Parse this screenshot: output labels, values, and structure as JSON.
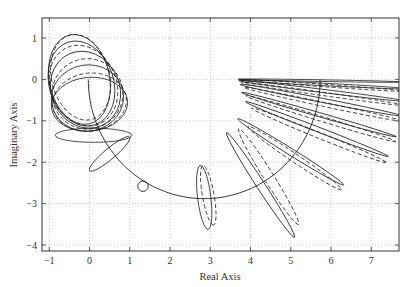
{
  "chart_data": {
    "type": "line",
    "title": "",
    "xlabel": "Real Axis",
    "ylabel": "Imaginary Axis",
    "xlim": [
      -1.18,
      7.69
    ],
    "ylim": [
      -4.14,
      1.48
    ],
    "grid": true,
    "x_ticks": [
      -1,
      0,
      1,
      2,
      3,
      4,
      5,
      6,
      7
    ],
    "x_tick_labels": [
      "−1",
      "0",
      "1",
      "2",
      "3",
      "4",
      "5",
      "6",
      "7"
    ],
    "y_ticks": [
      1,
      0,
      -1,
      -2,
      -3,
      -4
    ],
    "y_tick_labels": [
      "1",
      "0",
      "−1",
      "−2",
      "−3",
      "−4"
    ],
    "nominal_arc": {
      "center": [
        2.85,
        0
      ],
      "radius": 2.88,
      "from_deg": 180,
      "to_deg": 360
    },
    "marker_circle": {
      "center": [
        1.33,
        -2.58
      ],
      "radius": 0.13
    },
    "loops_solid": [
      {
        "cx": -0.25,
        "cy": 0.0,
        "rx": 0.75,
        "ry": 1.1,
        "rot": -12
      },
      {
        "cx": -0.2,
        "cy": -0.1,
        "rx": 0.8,
        "ry": 1.05,
        "rot": -18
      },
      {
        "cx": -0.1,
        "cy": -0.25,
        "rx": 0.85,
        "ry": 0.95,
        "rot": -25
      },
      {
        "cx": -0.05,
        "cy": -0.45,
        "rx": 0.9,
        "ry": 0.8,
        "rot": -10
      },
      {
        "cx": 0.0,
        "cy": -0.6,
        "rx": 0.95,
        "ry": 0.65,
        "rot": -5
      }
    ],
    "loops_dashed": [
      {
        "cx": -0.22,
        "cy": 0.05,
        "rx": 0.72,
        "ry": 1.05,
        "rot": -14
      },
      {
        "cx": -0.15,
        "cy": -0.15,
        "rx": 0.82,
        "ry": 1.0,
        "rot": -22
      },
      {
        "cx": -0.05,
        "cy": -0.35,
        "rx": 0.88,
        "ry": 0.85,
        "rot": -15
      },
      {
        "cx": 0.0,
        "cy": -0.55,
        "rx": 0.92,
        "ry": 0.7,
        "rot": -8
      }
    ],
    "ellipses_solid": [
      {
        "cx": 0.1,
        "cy": -1.35,
        "rx": 0.95,
        "ry": 0.17,
        "rot": 0
      },
      {
        "cx": 0.5,
        "cy": -1.8,
        "rx": 0.65,
        "ry": 0.13,
        "rot": -40
      },
      {
        "cx": 2.85,
        "cy": -2.85,
        "rx": 0.8,
        "ry": 0.16,
        "rot": 83
      },
      {
        "cx": 4.25,
        "cy": -2.55,
        "rx": 1.55,
        "ry": 0.1,
        "rot": 57
      },
      {
        "cx": 5.0,
        "cy": -1.75,
        "rx": 1.55,
        "ry": 0.08,
        "rot": 32
      },
      {
        "cx": 5.65,
        "cy": -1.2,
        "rx": 1.9,
        "ry": 0.06,
        "rot": 21
      },
      {
        "cx": 5.7,
        "cy": -0.85,
        "rx": 2.0,
        "ry": 0.05,
        "rot": 16
      },
      {
        "cx": 5.75,
        "cy": -0.5,
        "rx": 2.05,
        "ry": 0.05,
        "rot": 11
      },
      {
        "cx": 5.8,
        "cy": -0.28,
        "rx": 2.1,
        "ry": 0.04,
        "rot": 7
      },
      {
        "cx": 5.8,
        "cy": -0.12,
        "rx": 2.1,
        "ry": 0.03,
        "rot": 3
      },
      {
        "cx": 5.8,
        "cy": -0.03,
        "rx": 2.1,
        "ry": 0.02,
        "rot": 1
      }
    ],
    "ellipses_dashed": [
      {
        "cx": 2.95,
        "cy": -2.8,
        "rx": 0.75,
        "ry": 0.14,
        "rot": 80
      },
      {
        "cx": 4.45,
        "cy": -2.35,
        "rx": 1.4,
        "ry": 0.12,
        "rot": 58
      },
      {
        "cx": 5.1,
        "cy": -1.9,
        "rx": 1.4,
        "ry": 0.1,
        "rot": 34
      },
      {
        "cx": 5.7,
        "cy": -1.35,
        "rx": 1.8,
        "ry": 0.07,
        "rot": 22
      },
      {
        "cx": 5.75,
        "cy": -0.95,
        "rx": 1.95,
        "ry": 0.06,
        "rot": 17
      },
      {
        "cx": 5.8,
        "cy": -0.6,
        "rx": 2.0,
        "ry": 0.05,
        "rot": 12
      },
      {
        "cx": 5.8,
        "cy": -0.35,
        "rx": 2.05,
        "ry": 0.04,
        "rot": 8
      },
      {
        "cx": 5.85,
        "cy": -0.15,
        "rx": 2.05,
        "ry": 0.03,
        "rot": 4
      }
    ]
  },
  "layout": {
    "plot_px": {
      "left": 42,
      "top": 18,
      "right": 399,
      "bottom": 251
    },
    "x_map": {
      "origin_px": 89.5,
      "px_per_unit": 40.25
    },
    "y_map": {
      "origin_px": 79.4,
      "px_per_unit": 41.4
    }
  }
}
